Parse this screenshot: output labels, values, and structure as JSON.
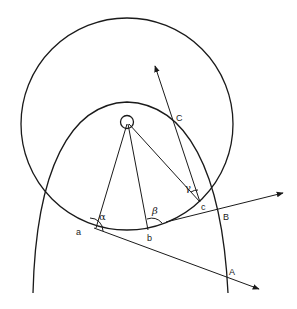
{
  "diagram": {
    "type": "geometric-optics-figure",
    "labels": {
      "point_a": "a",
      "point_b": "b",
      "point_c": "c",
      "point_A": "A",
      "point_B": "B",
      "point_C": "C",
      "angle_alpha": "α",
      "angle_beta": "β",
      "angle_gamma": "γ"
    },
    "colors": {
      "line": "#1a1a1a",
      "background": "#ffffff"
    }
  }
}
